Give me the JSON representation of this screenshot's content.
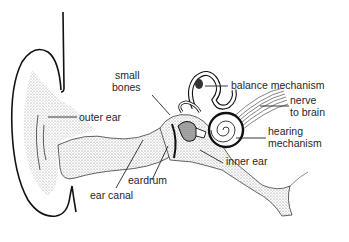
{
  "diagram": {
    "labels": {
      "small_bones_1": "small",
      "small_bones_2": "bones",
      "outer_ear": "outer ear",
      "balance_mechanism": "balance mechanism",
      "nerve_1": "nerve",
      "nerve_2": "to brain",
      "hearing_1": "hearing",
      "hearing_2": "mechanism",
      "inner_ear": "inner ear",
      "eardrum": "eardrum",
      "ear_canal": "ear canal"
    },
    "colors": {
      "ink": "#1a1a1a",
      "stipple": "#8a8a8a",
      "background": "#ffffff"
    }
  }
}
